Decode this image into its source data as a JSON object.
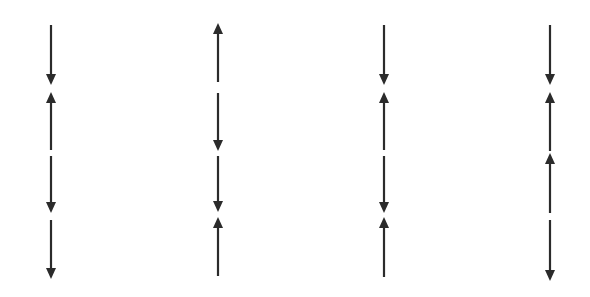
{
  "diagram": {
    "stroke_color": "#2b2b2b",
    "background": "#ffffff",
    "columns": [
      {
        "x": 51,
        "segments": [
          {
            "y1": 25,
            "y2": 85,
            "direction": "down"
          },
          {
            "y1": 92,
            "y2": 150,
            "direction": "up"
          },
          {
            "y1": 156,
            "y2": 213,
            "direction": "down"
          },
          {
            "y1": 220,
            "y2": 279,
            "direction": "down"
          }
        ]
      },
      {
        "x": 218,
        "segments": [
          {
            "y1": 23,
            "y2": 82,
            "direction": "up"
          },
          {
            "y1": 93,
            "y2": 151,
            "direction": "down"
          },
          {
            "y1": 156,
            "y2": 212,
            "direction": "down"
          },
          {
            "y1": 217,
            "y2": 276,
            "direction": "up"
          }
        ]
      },
      {
        "x": 384,
        "segments": [
          {
            "y1": 25,
            "y2": 85,
            "direction": "down"
          },
          {
            "y1": 92,
            "y2": 150,
            "direction": "up"
          },
          {
            "y1": 156,
            "y2": 213,
            "direction": "down"
          },
          {
            "y1": 217,
            "y2": 277,
            "direction": "up"
          }
        ]
      },
      {
        "x": 550,
        "segments": [
          {
            "y1": 25,
            "y2": 85,
            "direction": "down"
          },
          {
            "y1": 92,
            "y2": 151,
            "direction": "up"
          },
          {
            "y1": 153,
            "y2": 213,
            "direction": "up"
          },
          {
            "y1": 220,
            "y2": 281,
            "direction": "down"
          }
        ]
      }
    ]
  }
}
